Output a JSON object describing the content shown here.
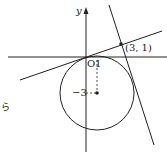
{
  "diagram": {
    "axes": {
      "x_label": "",
      "y_label": "y",
      "origin_label": "O"
    },
    "labels": {
      "tick_x": "1",
      "tick_y": "−3",
      "point": "(3, 1)",
      "side_text": "ら"
    },
    "circle": {
      "center": [
        1,
        -3
      ],
      "tangent_at_origin": true
    },
    "tangent_lines": [
      {
        "through": [
          0,
          0
        ],
        "to": [
          3,
          1
        ]
      },
      {
        "through": [
          3,
          1
        ],
        "tangent_to_circle": true
      }
    ],
    "colors": {
      "stroke": "#222222",
      "background": "#ffffff"
    }
  }
}
